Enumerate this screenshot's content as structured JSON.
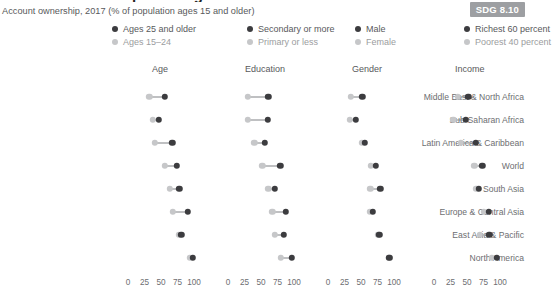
{
  "title_cut": "Account ownership is rising",
  "subtitle": "Account ownership, 2017 (% of population ages 15 and older)",
  "badge": "SDG 8.10",
  "colors": {
    "dark": "#3c3c3f",
    "light": "#c6c7c9",
    "connector": "#808285",
    "badge_bg": "#9d9fa2"
  },
  "legend": [
    {
      "dark_label": "Ages 25 and older",
      "light_label": "Ages 15–24"
    },
    {
      "dark_label": "Secondary or more",
      "light_label": "Primary or less"
    },
    {
      "dark_label": "Male",
      "light_label": "Female"
    },
    {
      "dark_label": "Richest 60 percent",
      "light_label": "Poorest 40 percent"
    }
  ],
  "chart_data": {
    "type": "scatter",
    "title": "Account ownership, 2017 (% of population ages 15 and older)",
    "xlabel": "",
    "ylabel": "",
    "xlim": [
      0,
      100
    ],
    "xticks": [
      0,
      25,
      50,
      75,
      100
    ],
    "xtick_labels": [
      "0",
      "25",
      "50",
      "75",
      "100"
    ],
    "grid": false,
    "legend_position": "top",
    "categories": [
      "Middle East & North Africa",
      "Sub-Saharan Africa",
      "Latin America & Caribbean",
      "World",
      "South Asia",
      "Europe & Central Asia",
      "East Asia & Pacific",
      "North America"
    ],
    "panels": [
      {
        "name": "Age",
        "series": [
          {
            "name": "Ages 15–24",
            "key": "light",
            "values": [
              32,
              38,
              41,
              56,
              63,
              68,
              77,
              94
            ]
          },
          {
            "name": "Ages 25 and older",
            "key": "dark",
            "values": [
              56,
              47,
              67,
              74,
              78,
              91,
              81,
              98
            ]
          }
        ]
      },
      {
        "name": "Education",
        "series": [
          {
            "name": "Primary or less",
            "key": "light",
            "values": [
              30,
              30,
              40,
              52,
              61,
              67,
              71,
              80
            ]
          },
          {
            "name": "Secondary or more",
            "key": "dark",
            "values": [
              61,
              60,
              56,
              79,
              71,
              88,
              85,
              97
            ]
          }
        ]
      },
      {
        "name": "Gender",
        "series": [
          {
            "name": "Female",
            "key": "light",
            "values": [
              35,
              33,
              51,
              65,
              64,
              63,
              76,
              93
            ]
          },
          {
            "name": "Male",
            "key": "dark",
            "values": [
              52,
              42,
              56,
              72,
              79,
              68,
              78,
              93
            ]
          }
        ]
      },
      {
        "name": "Income",
        "series": [
          {
            "name": "Poorest 40 percent",
            "key": "light",
            "values": [
              36,
              29,
              41,
              61,
              64,
              75,
              69,
              88
            ]
          },
          {
            "name": "Richest 60 percent",
            "key": "dark",
            "values": [
              52,
              48,
              63,
              73,
              68,
              83,
              84,
              95
            ]
          }
        ]
      }
    ]
  }
}
